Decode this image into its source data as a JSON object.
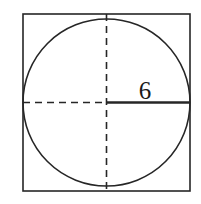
{
  "figure": {
    "background_color": "#ffffff",
    "stroke_color": "#262626",
    "label_color": "#1a1a1a",
    "square": {
      "name": "outer-square",
      "x": 23,
      "y": 14,
      "width": 167,
      "height": 177,
      "stroke_width": 1.6,
      "fill": "none"
    },
    "circle": {
      "name": "inscribed-circle",
      "cx": 106.5,
      "cy": 102.5,
      "r": 83.5,
      "stroke_width": 1.6,
      "fill": "none"
    },
    "vertical_diameter": {
      "name": "vertical-dashed-diameter",
      "x": 106.5,
      "y1": 14,
      "y2": 191,
      "style": "dashed",
      "dash_pattern": "7 5",
      "stroke_width": 1.6
    },
    "horizontal_left_radius": {
      "name": "horizontal-dashed-radius",
      "y": 102.5,
      "x1": 23,
      "x2": 106.5,
      "style": "dashed",
      "dash_pattern": "7 5",
      "stroke_width": 1.6
    },
    "horizontal_right_radius": {
      "name": "labeled-solid-radius",
      "y": 102.5,
      "x1": 106.5,
      "x2": 190,
      "style": "solid",
      "stroke_width": 2.4
    },
    "radius_label": {
      "name": "radius-length-label",
      "text": "6",
      "x": 145,
      "y": 99,
      "font_size": 25
    }
  }
}
